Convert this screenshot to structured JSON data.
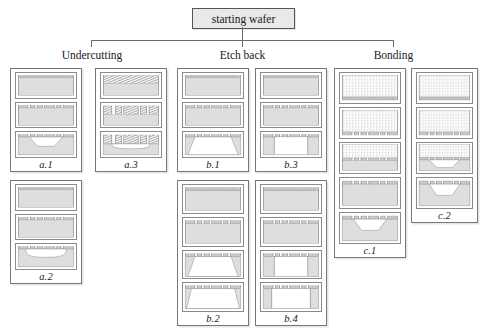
{
  "diagram": {
    "title_box": {
      "label": "starting wafer"
    },
    "branches": [
      {
        "id": "undercutting",
        "label": "Undercutting"
      },
      {
        "id": "etch-back",
        "label": "Etch back"
      },
      {
        "id": "bonding",
        "label": "Bonding"
      }
    ],
    "colors": {
      "substrate": "#dedede",
      "substrate_stroke": "#7d7d7d",
      "mask": "#c9c9c9",
      "glass_fill": "#fbfbfb",
      "glass_dot": "#9a9a9a",
      "hatch": "#8f8f8f",
      "panel_border": "#777777",
      "tree_line": "#6a6a6a",
      "box_fill": "#e9e9e9",
      "page_bg": "#ffffff"
    },
    "panels": [
      {
        "id": "a1",
        "label": "a.1",
        "branch": "undercutting",
        "x": 10,
        "y": 68,
        "w": 72,
        "h": 104,
        "steps": [
          {
            "kind": "blank-mask",
            "desc": "uniform substrate with full mask layer"
          },
          {
            "kind": "patterned-mask",
            "desc": "mask patterned into windows"
          },
          {
            "kind": "trapezoid-etch",
            "desc": "anisotropic trapezoidal cavity etched"
          }
        ]
      },
      {
        "id": "a2",
        "label": "a.2",
        "branch": "undercutting",
        "x": 10,
        "y": 180,
        "w": 72,
        "h": 104,
        "steps": [
          {
            "kind": "blank-mask",
            "desc": "uniform substrate with full mask layer"
          },
          {
            "kind": "patterned-mask",
            "desc": "mask patterned into windows"
          },
          {
            "kind": "undercut-etch",
            "desc": "isotropic undercut cavity beneath mask"
          }
        ]
      },
      {
        "id": "a3",
        "label": "a.3",
        "branch": "undercutting",
        "x": 95,
        "y": 68,
        "w": 72,
        "h": 104,
        "steps": [
          {
            "kind": "hatch-layer",
            "desc": "hatched sacrificial layer deposited on substrate"
          },
          {
            "kind": "hatch-patterned",
            "desc": "hatched layer patterned into blocks"
          },
          {
            "kind": "hatch-undercut",
            "desc": "undercut released beneath hatched blocks"
          }
        ]
      },
      {
        "id": "b1",
        "label": "b.1",
        "branch": "etch-back",
        "x": 177,
        "y": 68,
        "w": 72,
        "h": 104,
        "steps": [
          {
            "kind": "blank-mask",
            "desc": "uniform substrate with full mask layer"
          },
          {
            "kind": "patterned-mask",
            "desc": "mask patterned into windows"
          },
          {
            "kind": "wide-trapezoid",
            "desc": "wide trapezoidal etch back through substrate"
          }
        ]
      },
      {
        "id": "b2",
        "label": "b.2",
        "branch": "etch-back",
        "x": 177,
        "y": 180,
        "w": 72,
        "h": 146,
        "steps": [
          {
            "kind": "blank-mask",
            "desc": "uniform substrate with full mask layer"
          },
          {
            "kind": "patterned-mask",
            "desc": "mask patterned into windows"
          },
          {
            "kind": "wide-trapezoid",
            "desc": "wide trapezoidal etch back"
          },
          {
            "kind": "wide-trapezoid-2",
            "desc": "etch back continued, membrane thinned"
          }
        ]
      },
      {
        "id": "b3",
        "label": "b.3",
        "branch": "etch-back",
        "x": 255,
        "y": 68,
        "w": 72,
        "h": 104,
        "steps": [
          {
            "kind": "blank-mask",
            "desc": "uniform substrate with full mask layer"
          },
          {
            "kind": "patterned-mask",
            "desc": "mask patterned into windows"
          },
          {
            "kind": "vertical-etch",
            "desc": "deep vertical sidewall etch back"
          }
        ]
      },
      {
        "id": "b4",
        "label": "b.4",
        "branch": "etch-back",
        "x": 255,
        "y": 180,
        "w": 72,
        "h": 146,
        "steps": [
          {
            "kind": "blank-mask",
            "desc": "uniform substrate with full mask layer"
          },
          {
            "kind": "patterned-mask",
            "desc": "mask patterned into windows"
          },
          {
            "kind": "vertical-etch",
            "desc": "deep vertical sidewall etch back"
          },
          {
            "kind": "vertical-etch-2",
            "desc": "vertical etch back continued"
          }
        ]
      },
      {
        "id": "c1",
        "label": "c.1",
        "branch": "bonding",
        "x": 334,
        "y": 68,
        "w": 72,
        "h": 190,
        "steps": [
          {
            "kind": "glass-blank",
            "desc": "dotted glass wafer with bond layer"
          },
          {
            "kind": "glass-patterned",
            "desc": "bond layer patterned into windows"
          },
          {
            "kind": "glass-on-si",
            "desc": "glass wafer bonded onto silicon substrate"
          },
          {
            "kind": "patterned-mask",
            "desc": "silicon side mask patterned"
          },
          {
            "kind": "trapezoid-etch",
            "desc": "trapezoidal cavity etched in bonded stack"
          }
        ]
      },
      {
        "id": "c2",
        "label": "c.2",
        "branch": "bonding",
        "x": 411,
        "y": 68,
        "w": 67,
        "h": 155,
        "steps": [
          {
            "kind": "glass-blank",
            "desc": "dotted glass wafer with bond layer"
          },
          {
            "kind": "glass-patterned",
            "desc": "bond layer patterned into windows"
          },
          {
            "kind": "glass-bonded-etch",
            "desc": "glass bonded, trapezoidal cavity in silicon"
          },
          {
            "kind": "trapezoid-etch",
            "desc": "released trapezoidal cavity structure"
          }
        ]
      }
    ]
  }
}
